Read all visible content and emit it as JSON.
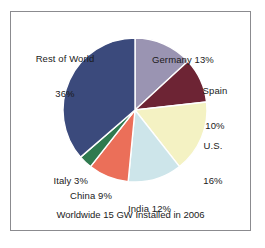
{
  "chart_data": {
    "type": "pie",
    "title": "",
    "caption": "Worldwide 15 GW Installed in 2006",
    "unit": "%",
    "total_label": "15 GW",
    "year": "2006",
    "legend": "none (direct labels)",
    "start_angle_deg": 0,
    "direction": "clockwise",
    "categories": [
      "Germany",
      "Spain",
      "U.S.",
      "India",
      "China",
      "Italy",
      "Rest of World"
    ],
    "values": [
      13,
      10,
      16,
      12,
      9,
      3,
      36
    ],
    "colors": [
      "#9a94b2",
      "#6d2434",
      "#f4f2c3",
      "#cde5ea",
      "#eb6f59",
      "#2f7a4f",
      "#3b4a7c"
    ],
    "slices": [
      {
        "name": "Germany",
        "value": 13,
        "label": "Germany 13%",
        "label_lines": [
          "Germany 13%"
        ],
        "color": "#9a94b2"
      },
      {
        "name": "Spain",
        "value": 10,
        "label": "Spain 10%",
        "label_lines": [
          "Spain",
          "10%"
        ],
        "color": "#6d2434"
      },
      {
        "name": "U.S.",
        "value": 16,
        "label": "U.S. 16%",
        "label_lines": [
          "U.S.",
          "16%"
        ],
        "color": "#f4f2c3"
      },
      {
        "name": "India",
        "value": 12,
        "label": "India 12%",
        "label_lines": [
          "India 12%"
        ],
        "color": "#cde5ea"
      },
      {
        "name": "China",
        "value": 9,
        "label": "China 9%",
        "label_lines": [
          "China 9%"
        ],
        "color": "#eb6f59"
      },
      {
        "name": "Italy",
        "value": 3,
        "label": "Italy 3%",
        "label_lines": [
          "Italy 3%"
        ],
        "color": "#2f7a4f"
      },
      {
        "name": "Rest of World",
        "value": 36,
        "label": "Rest of World 36%",
        "label_lines": [
          "Rest of World",
          "36%"
        ],
        "color": "#3b4a7c"
      }
    ]
  },
  "labels": {
    "germany": "Germany 13%",
    "spain_line1": "Spain",
    "spain_line2": "10%",
    "us_line1": "U.S.",
    "us_line2": "16%",
    "india": "India 12%",
    "china": "China 9%",
    "italy": "Italy 3%",
    "rest_line1": "Rest of World",
    "rest_line2": "36%"
  },
  "caption": "Worldwide 15 GW Installed in 2006",
  "style": {
    "page_background": "#ffffff",
    "frame_border": "#8b8b8f",
    "text_color": "#1a1a1a",
    "slice_separator": "#ffffff"
  }
}
